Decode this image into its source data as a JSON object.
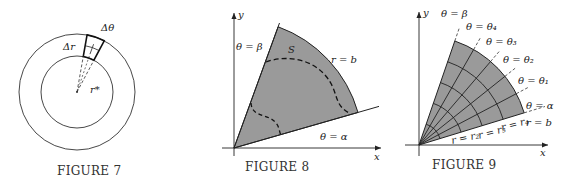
{
  "figures": [
    {
      "id": "figure7",
      "caption": "FIGURE 7",
      "labels": {
        "delta_theta": "Δθ",
        "delta_r": "Δr",
        "r_star": "r*"
      },
      "geometry": {
        "center": [
          77,
          92
        ],
        "inner_radius": 36,
        "outer_radius": 58,
        "sector_angles_deg": [
          62,
          80
        ]
      }
    },
    {
      "id": "figure8",
      "caption": "FIGURE 8",
      "labels": {
        "y_axis": "y",
        "x_axis": "x",
        "theta_beta": "θ = β",
        "theta_alpha": "θ = α",
        "r_b": "r = b",
        "region": "S"
      },
      "geometry": {
        "origin": [
          234,
          148
        ],
        "alpha_deg": 16,
        "beta_deg": 70,
        "outer_radius": 129
      },
      "colors": {
        "fill": "#9a9a9a",
        "stroke": "#222222"
      }
    },
    {
      "id": "figure9",
      "caption": "FIGURE 9",
      "labels": {
        "y_axis": "y",
        "x_axis": "x",
        "theta_beta": "θ = β",
        "theta_4": "θ = θ₄",
        "theta_3": "θ = θ₃",
        "theta_2": "θ = θ₂",
        "theta_1": "θ = θ₁",
        "theta_alpha": "θ = α",
        "r_b": "r = b",
        "r_4": "r = r₄",
        "r_3": "r = r₃",
        "r_2": "r = r₂"
      },
      "geometry": {
        "origin": [
          419,
          145
        ],
        "alpha_deg": 17,
        "beta_deg": 71,
        "outer_radius": 110,
        "radial_divisions": 5,
        "angular_divisions": 5
      },
      "colors": {
        "fill": "#9a9a9a",
        "stroke": "#222222"
      }
    }
  ]
}
